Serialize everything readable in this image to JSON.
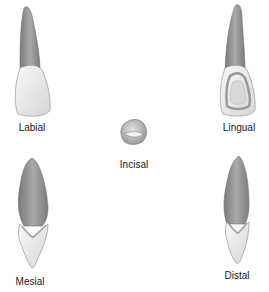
{
  "diagram": {
    "views": [
      {
        "id": "labial",
        "label": "Labial"
      },
      {
        "id": "lingual",
        "label": "Lingual"
      },
      {
        "id": "incisal",
        "label": "Incisal"
      },
      {
        "id": "mesial",
        "label": "Mesial"
      },
      {
        "id": "distal",
        "label": "Distal"
      }
    ],
    "colors": {
      "root": "#8e8e8e",
      "root_highlight": "#b8b8b8",
      "crown": "#e6e6e6",
      "crown_highlight": "#f7f7f7",
      "outline": "#6e6e6e",
      "label": "#1a1a1a"
    }
  }
}
